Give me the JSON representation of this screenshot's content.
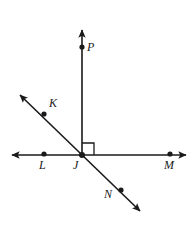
{
  "figure": {
    "width": 196,
    "height": 231,
    "background_color": "#ffffff",
    "stroke_color": "#1a1a1a",
    "stroke_width": 1.6,
    "dot_radius": 2.6
  },
  "labels": {
    "P": "P",
    "K": "K",
    "L": "L",
    "J": "J",
    "M": "M",
    "N": "N"
  },
  "points": [
    {
      "name": "P",
      "x": 82,
      "y": 47,
      "label_x": 87,
      "label_y": 41
    },
    {
      "name": "K",
      "x": 44,
      "y": 114,
      "label_x": 49,
      "label_y": 97
    },
    {
      "name": "L",
      "x": 44,
      "y": 154,
      "label_x": 39,
      "label_y": 159
    },
    {
      "name": "J",
      "x": 82,
      "y": 155,
      "label_x": 73,
      "label_y": 159
    },
    {
      "name": "M",
      "x": 170,
      "y": 154,
      "label_x": 164,
      "label_y": 159
    },
    {
      "name": "N",
      "x": 121,
      "y": 190,
      "label_x": 104,
      "label_y": 188
    }
  ],
  "lines": [
    {
      "name": "ray-JP-vertical",
      "kind": "ray",
      "from": {
        "x": 82,
        "y": 155
      },
      "to": {
        "x": 82,
        "y": 30
      },
      "arrow_start": false,
      "arrow_end": true
    },
    {
      "name": "line-LM-horizontal",
      "kind": "line",
      "from": {
        "x": 12,
        "y": 155
      },
      "to": {
        "x": 186,
        "y": 155
      },
      "arrow_start": true,
      "arrow_end": true
    },
    {
      "name": "line-KN-diagonal",
      "kind": "line",
      "from": {
        "x": 20,
        "y": 95
      },
      "to": {
        "x": 140,
        "y": 211
      },
      "arrow_start": true,
      "arrow_end": true
    }
  ],
  "right_angle": {
    "name": "right-angle-PJM",
    "vertex": {
      "x": 82,
      "y": 155
    },
    "size": 12,
    "direction": "up-right",
    "measure": "90"
  }
}
